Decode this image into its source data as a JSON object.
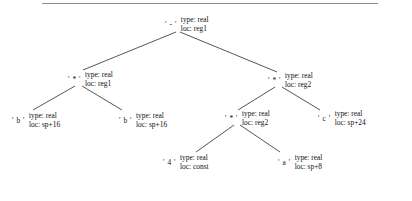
{
  "figure": {
    "kind": "annotated-syntax-tree",
    "rule_color": "#8c8c8c",
    "edge_color": "#2b2b2b",
    "text_color": "#111111",
    "background": "#ffffff"
  },
  "tree": {
    "root": {
      "id": "n-root",
      "symbol": "' - '",
      "type_label": "type: real",
      "loc_label": "loc: reg1"
    },
    "mul_left": {
      "id": "n-mul-left",
      "symbol": "' * '",
      "type_label": "type: real",
      "loc_label": "loc: reg1"
    },
    "b_left": {
      "id": "n-b-left",
      "symbol": "' b '",
      "type_label": "type: real",
      "loc_label": "loc: sp+16"
    },
    "b_right": {
      "id": "n-b-right",
      "symbol": "' b '",
      "type_label": "type: real",
      "loc_label": "loc: sp+16"
    },
    "mul_right": {
      "id": "n-mul-right",
      "symbol": "' * '",
      "type_label": "type: real",
      "loc_label": "loc: reg2"
    },
    "mul_inner": {
      "id": "n-mul-inner",
      "symbol": "' * '",
      "type_label": "type: real",
      "loc_label": "loc: reg2"
    },
    "const_four": {
      "id": "n-const-four",
      "symbol": "' 4 '",
      "type_label": "type: real",
      "loc_label": "loc: const"
    },
    "var_a": {
      "id": "n-var-a",
      "symbol": "' a '",
      "type_label": "type: real",
      "loc_label": "loc: sp+8"
    },
    "var_c": {
      "id": "n-var-c",
      "symbol": "' c '",
      "type_label": "type: real",
      "loc_label": "loc: sp+24"
    }
  }
}
